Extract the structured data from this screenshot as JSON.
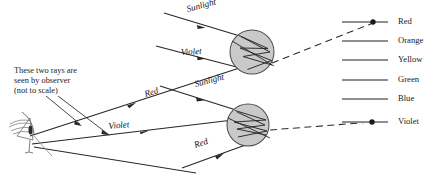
{
  "figure": {
    "title_text_block": {
      "lines": [
        "These two rays are",
        "seen by observer",
        "(not to scale)"
      ],
      "line1": "These two rays are",
      "line2": "seen by observer",
      "line3": "(not to scale)"
    },
    "ray_labels": {
      "sunlight_upper": "Sunlight",
      "violet_upper": "Violet",
      "red_middle": "Red",
      "sunlight_lower": "Sunlight",
      "violet_lower": "Violet",
      "red_lower": "Red"
    },
    "spectrum_legend": {
      "entries": [
        {
          "label": "Red",
          "color": "#8f8f8f",
          "y": 22,
          "has_dot": true
        },
        {
          "label": "Orange",
          "color": "#8f8f8f",
          "y": 41,
          "has_dot": false
        },
        {
          "label": "Yellow",
          "color": "#8f8f8f",
          "y": 60,
          "has_dot": false
        },
        {
          "label": "Green",
          "color": "#8f8f8f",
          "y": 80,
          "has_dot": false
        },
        {
          "label": "Blue",
          "color": "#8f8f8f",
          "y": 99,
          "has_dot": false
        },
        {
          "label": "Violet",
          "color": "#8f8f8f",
          "y": 122,
          "has_dot": true
        }
      ]
    },
    "raindrops": {
      "upper": {
        "cx": 252,
        "cy": 52,
        "r": 22
      },
      "lower": {
        "cx": 248,
        "cy": 125,
        "r": 21
      }
    },
    "colors": {
      "ink": "#1a1a1a",
      "ray_stroke": "#262626",
      "drop_fill": "#c9c9c9",
      "drop_stroke": "#4d4d4d",
      "legend_bar": "#8f8f8f",
      "dot": "#1a1a1a",
      "dash": "#2b2b2b",
      "observer": "#8a8a8a"
    },
    "observer": {
      "name": "observer-figure",
      "x": 22,
      "y": 132
    }
  }
}
